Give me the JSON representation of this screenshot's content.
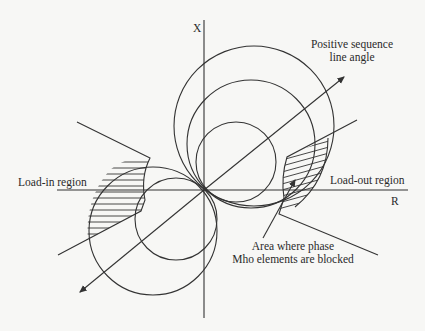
{
  "diagram": {
    "axes": {
      "x_label": "X",
      "r_label": "R"
    },
    "labels": {
      "pos_seq_line1": "Positive sequence",
      "pos_seq_line2": "line angle",
      "load_in": "Load-in region",
      "load_out": "Load-out region",
      "blocked_line1": "Area where phase",
      "blocked_line2": "Mho elements are blocked"
    },
    "elements": [
      "X axis (reactance)",
      "R axis (resistance)",
      "Positive sequence line angle (double-headed arrow)",
      "Three forward mho circles (upper right)",
      "Two reverse mho circles (lower left)",
      "Load-in blinder with hatched blocked area",
      "Load-out blinder with hatched blocked area"
    ],
    "colors": {
      "line": "#333333",
      "background": "#f7f7f5",
      "text": "#2a2a2a"
    }
  }
}
